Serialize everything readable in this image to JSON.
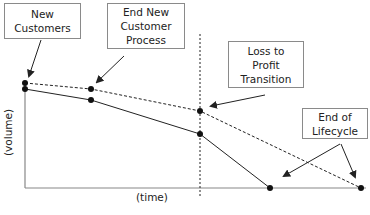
{
  "diagram": {
    "type": "customer lifecycle volume over time",
    "axes": {
      "xlabel": "(time)",
      "ylabel": "(volume)"
    },
    "callouts": [
      {
        "id": "new-customers",
        "lines": [
          "New",
          "Customers"
        ]
      },
      {
        "id": "end-new-customer-process",
        "lines": [
          "End New",
          "Customer",
          "Process"
        ]
      },
      {
        "id": "loss-to-profit-transition",
        "lines": [
          "Loss to",
          "Profit",
          "Transition"
        ]
      },
      {
        "id": "end-of-lifecycle",
        "lines": [
          "End of",
          "Lifecycle"
        ]
      }
    ],
    "series": [
      {
        "name": "dashed-line",
        "style": "dashed",
        "points": [
          [
            0,
            100
          ],
          [
            20,
            95
          ],
          [
            51,
            74
          ],
          [
            99,
            0
          ]
        ]
      },
      {
        "name": "solid-line",
        "style": "solid",
        "points": [
          [
            0,
            95
          ],
          [
            20,
            85
          ],
          [
            51,
            52
          ],
          [
            72,
            0
          ]
        ]
      }
    ],
    "markers": {
      "vertical_divider_x_pct": 51
    },
    "colors": {
      "line": "#222222",
      "box_border": "#8a8a8a",
      "axis": "#888888"
    }
  }
}
